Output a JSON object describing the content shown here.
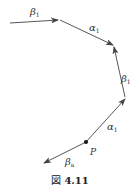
{
  "figure": {
    "caption_prefix": "図",
    "caption_number": "4.11"
  },
  "diagram": {
    "stroke_color": "#444444",
    "point": {
      "label": "P",
      "x": 86,
      "y": 142
    },
    "arrows": [
      {
        "id": "beta1-top",
        "label_main": "β",
        "label_sub": "1",
        "from": [
          10,
          23
        ],
        "to": [
          58,
          20
        ],
        "label_pos": [
          30,
          15
        ]
      },
      {
        "id": "alpha1-upper",
        "label_main": "α",
        "label_sub": "1",
        "from": [
          60,
          20
        ],
        "to": [
          113,
          45
        ],
        "label_pos": [
          90,
          30
        ]
      },
      {
        "id": "beta1-right",
        "label_main": "β",
        "label_sub": "1",
        "from": [
          125,
          97
        ],
        "to": [
          114,
          47
        ],
        "label_pos": [
          122,
          80
        ]
      },
      {
        "id": "alpha1-lower",
        "label_main": "α",
        "label_sub": "1",
        "from": [
          86,
          142
        ],
        "to": [
          125,
          99
        ],
        "label_pos": [
          108,
          130
        ]
      },
      {
        "id": "beta-a",
        "label_main": "β",
        "label_sub": "a",
        "from": [
          86,
          142
        ],
        "to": [
          44,
          163
        ],
        "label_pos": [
          66,
          165
        ]
      }
    ]
  }
}
